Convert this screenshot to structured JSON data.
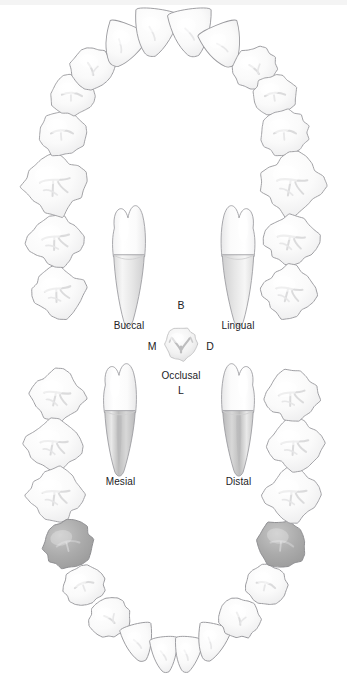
{
  "figure": {
    "background_color": "#ffffff",
    "tooth_fill": "#fbfbfb",
    "tooth_outline": "#9a9a9e",
    "highlight_fill": "#a8a8a8",
    "highlight_outline": "#8d8d90",
    "label_color": "#222226"
  },
  "views": [
    {
      "id": "buccal",
      "label": "Buccal",
      "x": 128,
      "y": 320
    },
    {
      "id": "lingual",
      "label": "Lingual",
      "x": 237,
      "y": 320
    },
    {
      "id": "occlusal",
      "label": "Occlusal",
      "x": 181,
      "y": 370
    },
    {
      "id": "mesial",
      "label": "Mesial",
      "x": 120,
      "y": 476
    },
    {
      "id": "distal",
      "label": "Distal",
      "x": 238,
      "y": 476
    }
  ],
  "orientation_letters": [
    {
      "id": "buccal-letter",
      "letter": "B",
      "x": 181,
      "y": 306,
      "meaning": "Buccal"
    },
    {
      "id": "mesial-letter",
      "letter": "M",
      "x": 153,
      "y": 346,
      "meaning": "Mesial"
    },
    {
      "id": "distal-letter",
      "letter": "D",
      "x": 210,
      "y": 346,
      "meaning": "Distal"
    },
    {
      "id": "lingual-letter",
      "letter": "L",
      "x": 181,
      "y": 390,
      "meaning": "Lingual"
    }
  ],
  "arches": [
    {
      "id": "maxillary",
      "name": "Upper arch",
      "tooth_count": 16,
      "highlighted_count": 0
    },
    {
      "id": "mandibular",
      "name": "Lower arch",
      "tooth_count": 16,
      "highlighted_count": 2,
      "highlighted_positions": [
        "lower-left-first-premolar",
        "lower-right-first-premolar"
      ]
    }
  ],
  "chart_data": {
    "type": "diagram",
    "upper_arch_teeth": [
      {
        "i": 1,
        "cx": 58,
        "cy": 292,
        "rx": 26,
        "ry": 25,
        "rot": -8,
        "type": "molar"
      },
      {
        "i": 2,
        "cx": 56,
        "cy": 240,
        "rx": 27,
        "ry": 25,
        "rot": -6,
        "type": "molar"
      },
      {
        "i": 3,
        "cx": 55,
        "cy": 184,
        "rx": 30,
        "ry": 30,
        "rot": -4,
        "type": "molar"
      },
      {
        "i": 4,
        "cx": 62,
        "cy": 133,
        "rx": 24,
        "ry": 23,
        "rot": 0,
        "type": "premolar"
      },
      {
        "i": 5,
        "cx": 72,
        "cy": 95,
        "rx": 22,
        "ry": 20,
        "rot": 4,
        "type": "premolar"
      },
      {
        "i": 6,
        "cx": 92,
        "cy": 68,
        "rx": 22,
        "ry": 21,
        "rot": 12,
        "type": "canine"
      },
      {
        "i": 7,
        "cx": 123,
        "cy": 45,
        "rx": 21,
        "ry": 22,
        "rot": 22,
        "type": "lateral"
      },
      {
        "i": 8,
        "cx": 155,
        "cy": 32,
        "rx": 22,
        "ry": 24,
        "rot": 8,
        "type": "central"
      },
      {
        "i": 9,
        "cx": 192,
        "cy": 32,
        "rx": 22,
        "ry": 24,
        "rot": -8,
        "type": "central"
      },
      {
        "i": 10,
        "cx": 224,
        "cy": 45,
        "rx": 21,
        "ry": 22,
        "rot": -22,
        "type": "lateral"
      },
      {
        "i": 11,
        "cx": 255,
        "cy": 68,
        "rx": 22,
        "ry": 21,
        "rot": -12,
        "type": "canine"
      },
      {
        "i": 12,
        "cx": 275,
        "cy": 95,
        "rx": 22,
        "ry": 20,
        "rot": -4,
        "type": "premolar"
      },
      {
        "i": 13,
        "cx": 285,
        "cy": 133,
        "rx": 24,
        "ry": 23,
        "rot": 0,
        "type": "premolar"
      },
      {
        "i": 14,
        "cx": 292,
        "cy": 184,
        "rx": 30,
        "ry": 30,
        "rot": 4,
        "type": "molar"
      },
      {
        "i": 15,
        "cx": 291,
        "cy": 240,
        "rx": 27,
        "ry": 25,
        "rot": 6,
        "type": "molar"
      },
      {
        "i": 16,
        "cx": 289,
        "cy": 292,
        "rx": 26,
        "ry": 25,
        "rot": 8,
        "type": "molar"
      }
    ],
    "lower_arch_teeth": [
      {
        "i": 1,
        "cx": 57,
        "cy": 396,
        "rx": 26,
        "ry": 25,
        "rot": 6,
        "type": "molar",
        "highlight": false
      },
      {
        "i": 2,
        "cx": 54,
        "cy": 445,
        "rx": 27,
        "ry": 25,
        "rot": 3,
        "type": "molar",
        "highlight": false
      },
      {
        "i": 3,
        "cx": 56,
        "cy": 495,
        "rx": 27,
        "ry": 26,
        "rot": 0,
        "type": "molar",
        "highlight": false
      },
      {
        "i": 4,
        "cx": 68,
        "cy": 544,
        "rx": 25,
        "ry": 24,
        "rot": -10,
        "type": "premolar",
        "highlight": true
      },
      {
        "i": 5,
        "cx": 84,
        "cy": 585,
        "rx": 21,
        "ry": 20,
        "rot": -16,
        "type": "premolar",
        "highlight": false
      },
      {
        "i": 6,
        "cx": 110,
        "cy": 618,
        "rx": 21,
        "ry": 20,
        "rot": -20,
        "type": "canine",
        "highlight": false
      },
      {
        "i": 7,
        "cx": 139,
        "cy": 642,
        "rx": 16,
        "ry": 19,
        "rot": -14,
        "type": "lateral",
        "highlight": false
      },
      {
        "i": 8,
        "cx": 165,
        "cy": 654,
        "rx": 14,
        "ry": 18,
        "rot": -6,
        "type": "central",
        "highlight": false
      },
      {
        "i": 9,
        "cx": 188,
        "cy": 654,
        "rx": 14,
        "ry": 18,
        "rot": 6,
        "type": "central",
        "highlight": false
      },
      {
        "i": 10,
        "cx": 212,
        "cy": 642,
        "rx": 16,
        "ry": 19,
        "rot": 14,
        "type": "lateral",
        "highlight": false
      },
      {
        "i": 11,
        "cx": 240,
        "cy": 618,
        "rx": 21,
        "ry": 20,
        "rot": 20,
        "type": "canine",
        "highlight": false
      },
      {
        "i": 12,
        "cx": 266,
        "cy": 585,
        "rx": 21,
        "ry": 20,
        "rot": 16,
        "type": "premolar",
        "highlight": false
      },
      {
        "i": 13,
        "cx": 282,
        "cy": 544,
        "rx": 25,
        "ry": 24,
        "rot": 10,
        "type": "premolar",
        "highlight": true
      },
      {
        "i": 14,
        "cx": 293,
        "cy": 495,
        "rx": 27,
        "ry": 26,
        "rot": 0,
        "type": "molar",
        "highlight": false
      },
      {
        "i": 15,
        "cx": 295,
        "cy": 445,
        "rx": 27,
        "ry": 25,
        "rot": -3,
        "type": "molar",
        "highlight": false
      },
      {
        "i": 16,
        "cx": 292,
        "cy": 396,
        "rx": 26,
        "ry": 25,
        "rot": -6,
        "type": "molar",
        "highlight": false
      }
    ]
  }
}
